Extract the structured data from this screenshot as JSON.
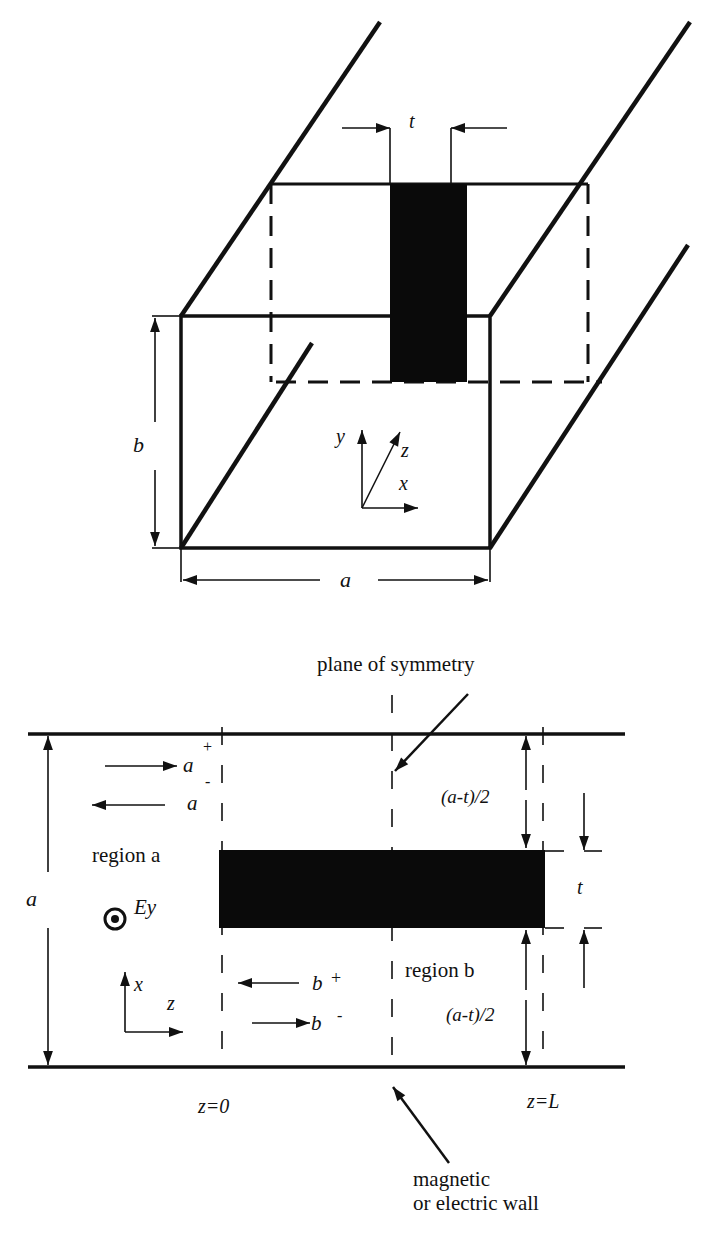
{
  "figure": {
    "top_view": {
      "dimension_t": "t",
      "dimension_b": "b",
      "dimension_a": "a",
      "axes": {
        "y": "y",
        "z": "z",
        "x": "x"
      }
    },
    "bottom_view": {
      "annotation_symmetry": "plane of symmetry",
      "annotation_wall_line1": "magnetic",
      "annotation_wall_line2": "or electric wall",
      "dimension_a": "a",
      "region_a_label": "region a",
      "region_b_label": "region b",
      "field_label": "Ey",
      "wave_a_plus": {
        "base": "a",
        "sup": "+"
      },
      "wave_a_minus": {
        "base": "a",
        "sup": "-"
      },
      "wave_b_plus": {
        "base": "b",
        "sup": "+"
      },
      "wave_b_minus": {
        "base": "b",
        "sup": "-"
      },
      "gap_upper": "(a-t)/2",
      "gap_lower": "(a-t)/2",
      "dimension_t": "t",
      "z_start": "z=0",
      "z_end": "z=L",
      "axes": {
        "x": "x",
        "z": "z"
      }
    },
    "colors": {
      "line": "#111111",
      "fill": "#0a0a0a",
      "background": "#ffffff"
    }
  }
}
